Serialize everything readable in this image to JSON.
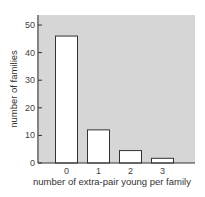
{
  "chart_data": {
    "type": "bar",
    "title": "",
    "xlabel": "number of extra-pair young per family",
    "ylabel": "number of families",
    "categories": [
      "0",
      "1",
      "2",
      "3"
    ],
    "values": [
      46,
      12,
      4.5,
      1.7
    ],
    "ylim": [
      0,
      52
    ],
    "yticks": [
      0,
      10,
      20,
      30,
      40,
      50
    ],
    "ytick_labels": [
      "0",
      "10",
      "20",
      "30",
      "40",
      "50"
    ],
    "grid": false,
    "legend": null,
    "colors": {
      "panel_background": "#d6d6d6",
      "bar_fill": "#ffffff",
      "bar_stroke": "#333333",
      "axis": "#333333"
    }
  }
}
